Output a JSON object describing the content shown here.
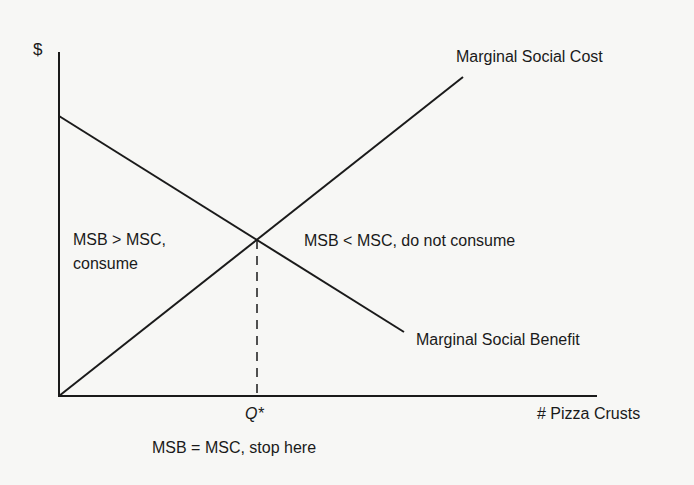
{
  "diagram": {
    "type": "economics-marginal-analysis",
    "y_axis_label": "$",
    "x_axis_label": "# Pizza Crusts",
    "curves": {
      "msc_label": "Marginal Social Cost",
      "msb_label": "Marginal Social Benefit"
    },
    "regions": {
      "left_line1": "MSB > MSC,",
      "left_line2": "consume",
      "right": "MSB < MSC, do not consume"
    },
    "equilibrium": {
      "q_label": "Q*",
      "caption": "MSB = MSC, stop here"
    },
    "colors": {
      "background": "#f7f7f5",
      "line": "#1a1a1a"
    }
  }
}
